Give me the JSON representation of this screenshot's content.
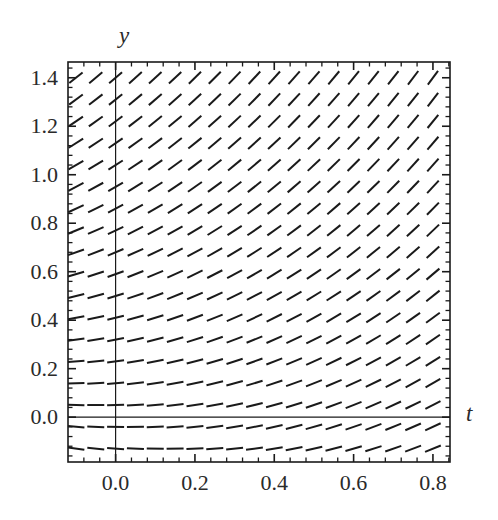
{
  "figure": {
    "kind": "slope-field-plot",
    "background_color": "#ffffff",
    "line_color": "#1a1a1a",
    "frame_color": "#1a1a1a",
    "axis_color": "#1a1a1a"
  },
  "axes": {
    "x_axis_label": "t",
    "y_axis_label": "y",
    "x_ticks": [
      "0.0",
      "0.2",
      "0.4",
      "0.6",
      "0.8"
    ],
    "y_ticks": [
      "0.0",
      "0.2",
      "0.4",
      "0.6",
      "0.8",
      "1.0",
      "1.2",
      "1.4"
    ]
  },
  "chart_data": {
    "type": "scatter",
    "plot_kind": "slope_field",
    "title": "",
    "xlabel": "t",
    "ylabel": "y",
    "xlim": [
      -0.12,
      0.84
    ],
    "ylim": [
      -0.18,
      1.46
    ],
    "x_ticks": [
      0.0,
      0.2,
      0.4,
      0.6,
      0.8
    ],
    "x_ticklabels": [
      "0.0",
      "0.2",
      "0.4",
      "0.6",
      "0.8"
    ],
    "y_ticks": [
      0.0,
      0.2,
      0.4,
      0.6,
      0.8,
      1.0,
      1.2,
      1.4
    ],
    "y_ticklabels": [
      "0.0",
      "0.2",
      "0.4",
      "0.6",
      "0.8",
      "1.0",
      "1.2",
      "1.4"
    ],
    "x_minor_tick_count": 4,
    "y_minor_tick_count": 4,
    "grid": false,
    "legend": null,
    "frame": true,
    "zero_axis_vertical": 0.0,
    "zero_axis_horizontal": 0.0,
    "slope_formula": "dy/dt = t + y",
    "grid_x_start": -0.1,
    "grid_x_step": 0.05,
    "grid_x_count": 19,
    "grid_y_start": -0.15,
    "grid_y_step": 0.09,
    "grid_y_count": 19,
    "segment_length_px": 17,
    "segment_rows": [
      {
        "y": 1.4,
        "slopes_at_t": [
          1.3,
          1.35,
          1.4,
          1.45,
          1.5,
          1.55,
          1.6,
          1.65,
          1.7,
          1.75,
          1.8,
          1.85,
          1.9,
          1.95,
          2.0,
          2.05,
          2.1,
          2.15,
          2.2
        ]
      },
      {
        "y": 1.31,
        "slopes_at_t": [
          1.21,
          1.26,
          1.31,
          1.36,
          1.41,
          1.46,
          1.51,
          1.56,
          1.61,
          1.66,
          1.71,
          1.76,
          1.81,
          1.86,
          1.91,
          1.96,
          2.01,
          2.06,
          2.11
        ]
      },
      {
        "y": 1.22,
        "slopes_at_t": [
          1.12,
          1.17,
          1.22,
          1.27,
          1.32,
          1.37,
          1.42,
          1.47,
          1.52,
          1.57,
          1.62,
          1.67,
          1.72,
          1.77,
          1.82,
          1.87,
          1.92,
          1.97,
          2.02
        ]
      },
      {
        "y": 1.13,
        "slopes_at_t": [
          1.03,
          1.08,
          1.13,
          1.18,
          1.23,
          1.28,
          1.33,
          1.38,
          1.43,
          1.48,
          1.53,
          1.58,
          1.63,
          1.68,
          1.73,
          1.78,
          1.83,
          1.88,
          1.93
        ]
      },
      {
        "y": 1.04,
        "slopes_at_t": [
          0.94,
          0.99,
          1.04,
          1.09,
          1.14,
          1.19,
          1.24,
          1.29,
          1.34,
          1.39,
          1.44,
          1.49,
          1.54,
          1.59,
          1.64,
          1.69,
          1.74,
          1.79,
          1.84
        ]
      },
      {
        "y": 0.95,
        "slopes_at_t": [
          0.85,
          0.9,
          0.95,
          1.0,
          1.05,
          1.1,
          1.15,
          1.2,
          1.25,
          1.3,
          1.35,
          1.4,
          1.45,
          1.5,
          1.55,
          1.6,
          1.65,
          1.7,
          1.75
        ]
      },
      {
        "y": 0.86,
        "slopes_at_t": [
          0.76,
          0.81,
          0.86,
          0.91,
          0.96,
          1.01,
          1.06,
          1.11,
          1.16,
          1.21,
          1.26,
          1.31,
          1.36,
          1.41,
          1.46,
          1.51,
          1.56,
          1.61,
          1.66
        ]
      },
      {
        "y": 0.77,
        "slopes_at_t": [
          0.67,
          0.72,
          0.77,
          0.82,
          0.87,
          0.92,
          0.97,
          1.02,
          1.07,
          1.12,
          1.17,
          1.22,
          1.27,
          1.32,
          1.37,
          1.42,
          1.47,
          1.52,
          1.57
        ]
      },
      {
        "y": 0.68,
        "slopes_at_t": [
          0.58,
          0.63,
          0.68,
          0.73,
          0.78,
          0.83,
          0.88,
          0.93,
          0.98,
          1.03,
          1.08,
          1.13,
          1.18,
          1.23,
          1.28,
          1.33,
          1.38,
          1.43,
          1.48
        ]
      },
      {
        "y": 0.59,
        "slopes_at_t": [
          0.49,
          0.54,
          0.59,
          0.64,
          0.69,
          0.74,
          0.79,
          0.84,
          0.89,
          0.94,
          0.99,
          1.04,
          1.09,
          1.14,
          1.19,
          1.24,
          1.29,
          1.34,
          1.39
        ]
      },
      {
        "y": 0.5,
        "slopes_at_t": [
          0.4,
          0.45,
          0.5,
          0.55,
          0.6,
          0.65,
          0.7,
          0.75,
          0.8,
          0.85,
          0.9,
          0.95,
          1.0,
          1.05,
          1.1,
          1.15,
          1.2,
          1.25,
          1.3
        ]
      },
      {
        "y": 0.41,
        "slopes_at_t": [
          0.31,
          0.36,
          0.41,
          0.46,
          0.51,
          0.56,
          0.61,
          0.66,
          0.71,
          0.76,
          0.81,
          0.86,
          0.91,
          0.96,
          1.01,
          1.06,
          1.11,
          1.16,
          1.21
        ]
      },
      {
        "y": 0.32,
        "slopes_at_t": [
          0.22,
          0.27,
          0.32,
          0.37,
          0.42,
          0.47,
          0.52,
          0.57,
          0.62,
          0.67,
          0.72,
          0.77,
          0.82,
          0.87,
          0.92,
          0.97,
          1.02,
          1.07,
          1.12
        ]
      },
      {
        "y": 0.23,
        "slopes_at_t": [
          0.13,
          0.18,
          0.23,
          0.28,
          0.33,
          0.38,
          0.43,
          0.48,
          0.53,
          0.58,
          0.63,
          0.68,
          0.73,
          0.78,
          0.83,
          0.88,
          0.93,
          0.98,
          1.03
        ]
      },
      {
        "y": 0.14,
        "slopes_at_t": [
          0.04,
          0.09,
          0.14,
          0.19,
          0.24,
          0.29,
          0.34,
          0.39,
          0.44,
          0.49,
          0.54,
          0.59,
          0.64,
          0.69,
          0.74,
          0.79,
          0.84,
          0.89,
          0.94
        ]
      },
      {
        "y": 0.05,
        "slopes_at_t": [
          -0.05,
          0.0,
          0.05,
          0.1,
          0.15,
          0.2,
          0.25,
          0.3,
          0.35,
          0.4,
          0.45,
          0.5,
          0.55,
          0.6,
          0.65,
          0.7,
          0.75,
          0.8,
          0.85
        ]
      },
      {
        "y": -0.04,
        "slopes_at_t": [
          -0.14,
          -0.09,
          -0.04,
          0.01,
          0.06,
          0.11,
          0.16,
          0.21,
          0.26,
          0.31,
          0.36,
          0.41,
          0.46,
          0.51,
          0.56,
          0.61,
          0.66,
          0.71,
          0.76
        ]
      },
      {
        "y": -0.13,
        "slopes_at_t": [
          -0.23,
          -0.18,
          -0.13,
          -0.08,
          -0.03,
          0.02,
          0.07,
          0.12,
          0.17,
          0.22,
          0.27,
          0.32,
          0.37,
          0.42,
          0.47,
          0.52,
          0.57,
          0.62,
          0.67
        ]
      }
    ]
  },
  "layout": {
    "plot_left_px": 68,
    "plot_right_px": 450,
    "plot_top_px": 62,
    "plot_bottom_px": 462,
    "x_data_min": -0.12,
    "x_data_max": 0.843,
    "y_data_min": -0.185,
    "y_data_max": 1.465,
    "y_label_pos": {
      "x": 119,
      "y": 24
    },
    "t_label_pos": {
      "x": 466,
      "y": 402
    }
  }
}
